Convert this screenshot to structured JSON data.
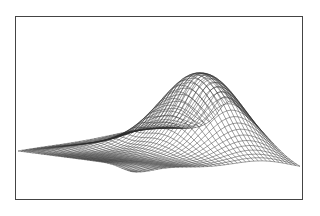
{
  "chart_data": {
    "type": "surface",
    "title": "",
    "xlabel": "",
    "ylabel": "",
    "zlabel": "",
    "grid": false,
    "legend": null,
    "mesh": {
      "rows": 40,
      "cols": 40
    },
    "corners_px": {
      "left": [
        18,
        151
      ],
      "back": [
        170,
        58
      ],
      "right": [
        300,
        170
      ],
      "front": [
        133,
        158
      ]
    },
    "peak_px": [
      170,
      50
    ],
    "frame_px": {
      "x": 15,
      "y": 16,
      "width": 288,
      "height": 184
    },
    "line_color": "#2a2a2a"
  }
}
